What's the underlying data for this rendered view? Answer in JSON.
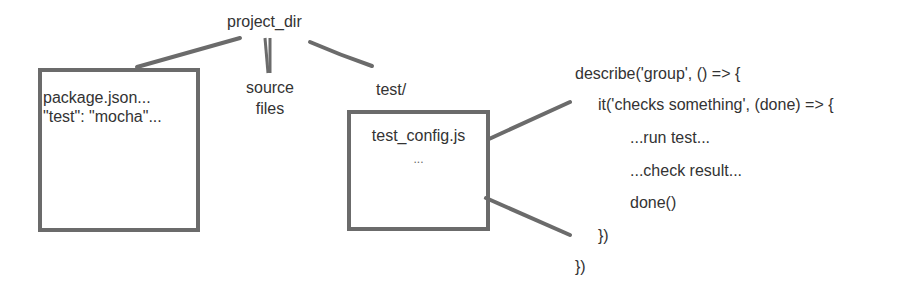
{
  "diagram": {
    "root": {
      "label": "project_dir"
    },
    "children": [
      {
        "id": "package",
        "box_lines": [
          "package.json...",
          "\"test\": \"mocha\"..."
        ]
      },
      {
        "id": "source",
        "label_lines": [
          "source",
          "files"
        ]
      },
      {
        "id": "test",
        "label": "test/",
        "box_lines": [
          "test_config.js",
          "..."
        ]
      }
    ],
    "code_snippet": {
      "lines": [
        "describe('group', () => {",
        "it('checks something', (done) => {",
        "...run test...",
        "...check result...",
        "done()",
        "})",
        "})"
      ]
    },
    "colors": {
      "stroke": "#6b6b6b",
      "text": "#333333",
      "background": "#ffffff"
    }
  }
}
